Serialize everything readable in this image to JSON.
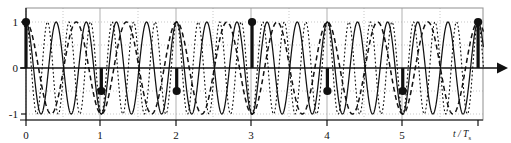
{
  "figure": {
    "title": "",
    "x_axis_label": "t / T",
    "x_axis_label_sub": "s",
    "y_ticks": [
      "1",
      "0",
      "-1"
    ],
    "x_ticks": [
      "0",
      "1",
      "2",
      "3",
      "4",
      "5"
    ],
    "colors": {
      "ink": "#111111",
      "frame": "#9a9a9a",
      "grid": "#b9b9b9",
      "background": "#ffffff"
    }
  },
  "chart_data": {
    "type": "line",
    "title": "",
    "xlabel": "t / Ts",
    "ylabel": "",
    "xlim": [
      -0.1,
      6.4
    ],
    "ylim": [
      -1.25,
      1.25
    ],
    "xticks": [
      0,
      1,
      2,
      3,
      4,
      5
    ],
    "yticks": [
      -1,
      0,
      1
    ],
    "grid": true,
    "legend": null,
    "series": [
      {
        "name": "solid-sinusoid",
        "style": "solid",
        "frequency_cycles_per_sample": 2.5,
        "amplitude": 1,
        "phase_deg": 90,
        "description": "cos(2*pi*2.5*t)"
      },
      {
        "name": "dashed-sinusoid",
        "style": "dashed",
        "frequency_cycles_per_sample": 1.5,
        "amplitude": 1,
        "phase_deg": 90,
        "description": "cos(2*pi*1.5*t)"
      },
      {
        "name": "dotted-sinusoid",
        "style": "dotted",
        "frequency_cycles_per_sample": 3.5,
        "amplitude": 1,
        "phase_deg": 90,
        "description": "cos(2*pi*3.5*t)"
      }
    ],
    "samples": {
      "name": "sample-points",
      "marker": "filled-circle",
      "stems": true,
      "x": [
        0,
        1,
        2,
        3,
        4,
        5,
        6
      ],
      "y": [
        1,
        -0.5,
        -0.5,
        1,
        -0.5,
        -0.5,
        1
      ]
    }
  }
}
